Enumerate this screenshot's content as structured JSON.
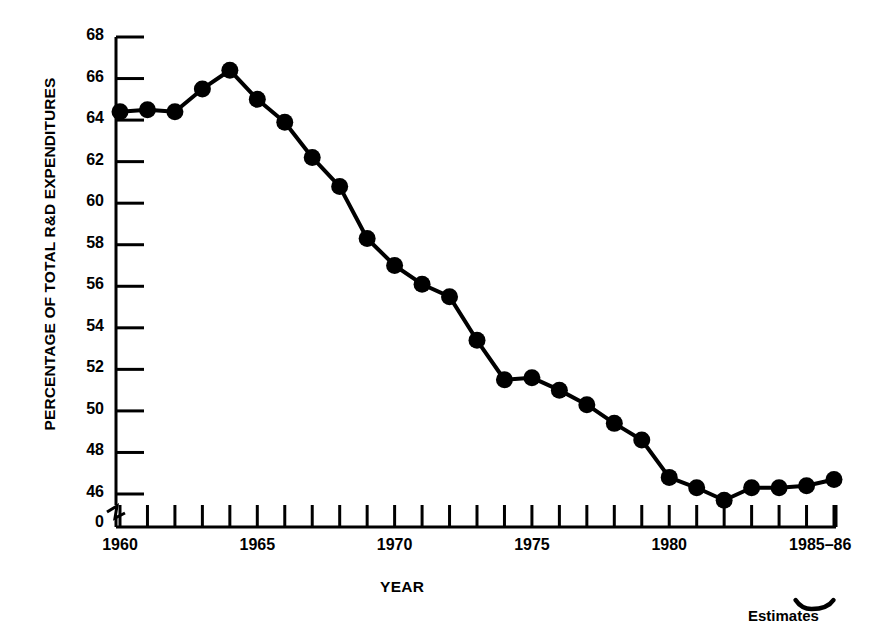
{
  "chart_data": {
    "type": "line",
    "title": "",
    "xlabel": "YEAR",
    "ylabel": "PERCENTAGE OF TOTAL R&D EXPENDITURES",
    "xlim": [
      1960,
      1986
    ],
    "ylim": [
      46,
      68
    ],
    "ytick_step": 2,
    "grid": false,
    "legend": null,
    "axis_break": true,
    "axis_break_value": "0",
    "marker": "filled-circle",
    "x": [
      1960,
      1961,
      1962,
      1963,
      1964,
      1965,
      1966,
      1967,
      1968,
      1969,
      1970,
      1971,
      1972,
      1973,
      1974,
      1975,
      1976,
      1977,
      1978,
      1979,
      1980,
      1981,
      1982,
      1983,
      1984,
      1985,
      1986
    ],
    "values": [
      64.4,
      64.5,
      64.4,
      65.5,
      66.4,
      65.0,
      63.9,
      62.2,
      60.8,
      58.3,
      57.0,
      56.1,
      55.5,
      53.4,
      51.5,
      51.6,
      51.0,
      50.3,
      49.4,
      48.6,
      46.8,
      46.3,
      45.7,
      46.3,
      46.3,
      46.4,
      46.7
    ],
    "ytick_labels": [
      "68",
      "66",
      "64",
      "62",
      "60",
      "58",
      "56",
      "54",
      "52",
      "50",
      "48",
      "46",
      "0"
    ],
    "xtick_labels": [
      {
        "label": "1960",
        "year": 1960
      },
      {
        "label": "1965",
        "year": 1965
      },
      {
        "label": "1970",
        "year": 1970
      },
      {
        "label": "1975",
        "year": 1975
      },
      {
        "label": "1980",
        "year": 1980
      },
      {
        "label": "1985–86",
        "year": 1985.5
      }
    ],
    "annotations": [
      {
        "text": "Estimates",
        "target": "1985–86",
        "style": "brace-below"
      }
    ],
    "line_color": "#000000",
    "marker_color": "#000000",
    "axis_color": "#000000",
    "background_color": "#ffffff"
  }
}
